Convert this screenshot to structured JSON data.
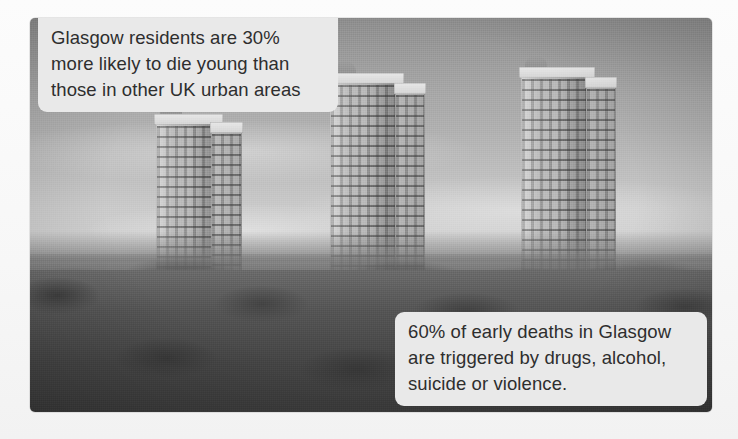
{
  "image": {
    "subject": "glasgow-tower-blocks-skyline-photograph",
    "treatment": "black-and-white-photograph",
    "alt": "Black and white photograph of three high-rise tower blocks rising above trees and suburban houses in Glasgow"
  },
  "captions": [
    {
      "id": "caption-top",
      "name": "caption-early-death-statistic",
      "text": "Glasgow residents are 30%\nmore likely to die young than\nthose in other UK urban areas",
      "lines": [
        "Glasgow residents are 30%",
        "more likely to die young than",
        "those in other UK urban areas"
      ],
      "statistic": "30%",
      "background_color": "#e9e9e9",
      "text_color": "#2e2e2e",
      "position": "top-left"
    },
    {
      "id": "caption-bottom",
      "name": "caption-early-death-causes",
      "text": "60% of early deaths in Glasgow\nare triggered by drugs, alcohol,\nsuicide or violence.",
      "lines": [
        "60% of early deaths in Glasgow",
        "are triggered by drugs, alcohol,",
        "suicide or violence."
      ],
      "statistic": "60%",
      "background_color": "#e9e9e9",
      "text_color": "#2e2e2e",
      "position": "bottom-right"
    }
  ],
  "scene": {
    "sky_color": "#a6a6a6",
    "vegetation_color": "#545454",
    "building_color": "#c2c2c2",
    "page_background": "#fbfbfb",
    "towers": [
      {
        "name": "tower-block-left",
        "left_pct": 18.5,
        "top_pct": 27.0,
        "width_pct": 9.5,
        "height_pct": 38.0
      },
      {
        "name": "tower-block-middle",
        "left_pct": 44.0,
        "top_pct": 16.5,
        "width_pct": 10.5,
        "height_pct": 50.0
      },
      {
        "name": "tower-block-right",
        "left_pct": 72.0,
        "top_pct": 15.0,
        "width_pct": 10.5,
        "height_pct": 52.0
      }
    ]
  }
}
